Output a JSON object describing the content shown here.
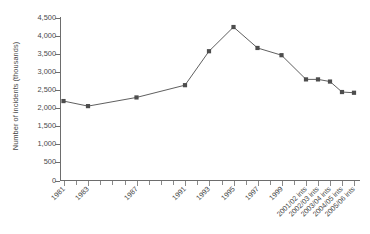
{
  "chart_data": {
    "type": "line",
    "title": "",
    "xlabel": "",
    "ylabel": "Number of incidents (thousands)",
    "ylim": [
      0,
      4500
    ],
    "ytick_values": [
      0,
      500,
      1000,
      1500,
      2000,
      2500,
      3000,
      3500,
      4000,
      4500
    ],
    "ytick_labels": [
      "0",
      "500",
      "1,000",
      "1,500",
      "2,000",
      "2,500",
      "3,000",
      "3,500",
      "4,000",
      "4,500"
    ],
    "grid": false,
    "legend": "none",
    "marker": "filled-square",
    "series_color": "#4d4d4d",
    "categories": [
      "1981",
      "1983",
      "1987",
      "1991",
      "1993",
      "1995",
      "1997",
      "1999",
      "2001/02 ints",
      "2002/03 ints",
      "2003/04 ints",
      "2004/05 ints",
      "2005/06 ints"
    ],
    "values": [
      2200,
      2060,
      2300,
      2640,
      3580,
      4250,
      3670,
      3470,
      2800,
      2800,
      2740,
      2450,
      2430
    ],
    "series": [
      {
        "name": "Number of incidents",
        "values": [
          2200,
          2060,
          2300,
          2640,
          3580,
          4250,
          3670,
          3470,
          2800,
          2800,
          2740,
          2450,
          2430
        ]
      }
    ],
    "points": [
      {
        "label": "1981",
        "value": 2200,
        "x_px": 63.5
      },
      {
        "label": "1983",
        "value": 2060,
        "x_px": 88.0
      },
      {
        "label": "1987",
        "value": 2300,
        "x_px": 136.5
      },
      {
        "label": "1991",
        "value": 2640,
        "x_px": 185.0
      },
      {
        "label": "1993",
        "value": 3580,
        "x_px": 209.0
      },
      {
        "label": "1995",
        "value": 4250,
        "x_px": 233.5
      },
      {
        "label": "1997",
        "value": 3670,
        "x_px": 257.5
      },
      {
        "label": "1999",
        "value": 3470,
        "x_px": 281.5
      },
      {
        "label": "2001/02 ints",
        "value": 2800,
        "x_px": 306.0
      },
      {
        "label": "2002/03 ints",
        "value": 2800,
        "x_px": 318.0
      },
      {
        "label": "2003/04 ints",
        "value": 2740,
        "x_px": 330.0
      },
      {
        "label": "2004/05 ints",
        "value": 2450,
        "x_px": 342.0
      },
      {
        "label": "2005/06 ints",
        "value": 2430,
        "x_px": 354.0
      }
    ],
    "x_axis_minor_ticks_px": [
      63.5,
      75.5,
      88.0,
      100.0,
      112.0,
      124.5,
      136.5,
      148.5,
      160.5,
      173.0,
      185.0,
      197.0,
      209.0,
      221.5,
      233.5,
      245.5,
      257.5,
      269.5,
      281.5,
      294.0,
      306.0,
      318.0,
      330.0,
      342.0,
      354.0
    ]
  }
}
